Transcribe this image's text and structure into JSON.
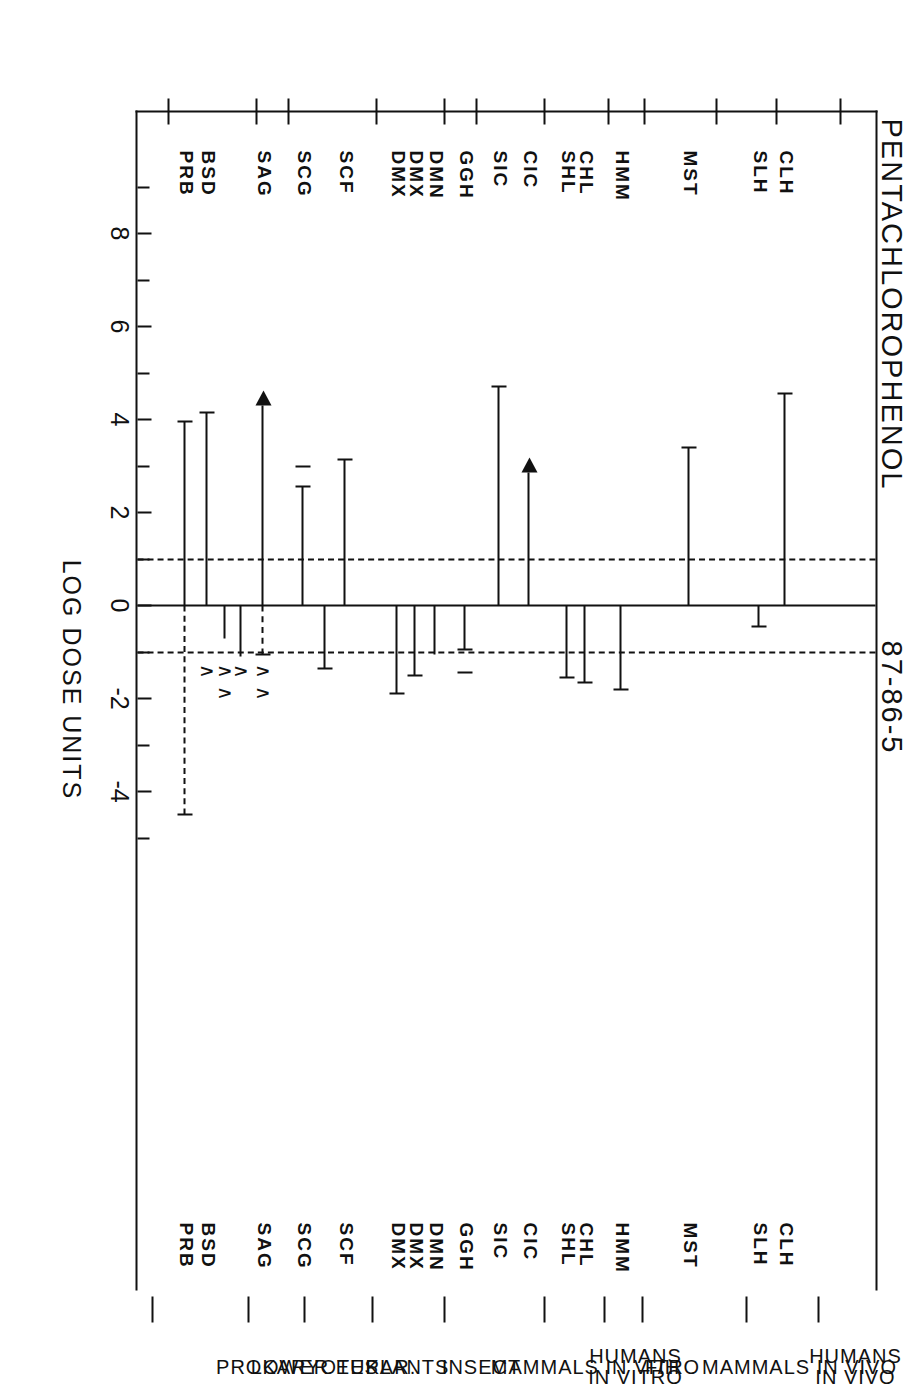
{
  "title": {
    "chemical_name": "PENTACHLOROPHENOL",
    "cas_number": "87-86-5"
  },
  "axis": {
    "label": "LOG DOSE UNITS",
    "ticks": [
      8,
      6,
      4,
      2,
      0,
      -2,
      -4
    ],
    "tick_labels": [
      "8",
      "6",
      "4",
      "2",
      "0",
      "-2",
      "-4"
    ],
    "minor_ticks": [
      9,
      7,
      5,
      3,
      1,
      -1,
      -3,
      -5
    ],
    "range": [
      9.5,
      -5.5
    ]
  },
  "reference_lines": {
    "zero_solid": 0,
    "dashed": [
      1,
      -1
    ]
  },
  "categories": [
    {
      "name": "PROKARYOTES"
    },
    {
      "name": "LOWER EUKAR."
    },
    {
      "name": "PLANTS"
    },
    {
      "name": "INSECT"
    },
    {
      "name": "MAMMALS IN VITRO"
    },
    {
      "name": "HUMANS\nIN VITRO"
    },
    {
      "name": "F/H"
    },
    {
      "name": "MAMMALS IN VIVO"
    },
    {
      "name": "HUMANS\nIN VIVO"
    }
  ],
  "chart_data": {
    "type": "bar",
    "title": "PENTACHLOROPHENOL  87-86-5",
    "xlabel": "LOG DOSE UNITS",
    "ylabel": "",
    "xlim": [
      9.5,
      -5.5
    ],
    "grid": false,
    "orientation": "horizontal-intervals",
    "note": "Each row is a study: a horizontal interval in log dose units anchored at 0. Caps mark determinate endpoints, arrowheads mark open-ended (greater-than) endpoints.",
    "rows": [
      {
        "code": "PRB",
        "category": "PROKARYOTES",
        "start": 0,
        "end": 3.95,
        "end_marker": "cap",
        "extra_dashed_to": -4.5,
        "carets": 0
      },
      {
        "code": "BSD",
        "category": "PROKARYOTES",
        "start": 0,
        "end": 4.15,
        "end_marker": "cap",
        "carets": 1
      },
      {
        "code": "",
        "category": "PROKARYOTES",
        "start": 0,
        "end": -0.7,
        "end_marker": "caret",
        "carets": 2
      },
      {
        "code": "",
        "category": "PROKARYOTES",
        "start": 0,
        "end": -1.1,
        "end_marker": "caret",
        "carets": 1
      },
      {
        "code": "SAG",
        "category": "PROKARYOTES",
        "start": 0,
        "end": 4.3,
        "end_marker": "arrow",
        "extra_dashed_to": -1.05,
        "carets": 2
      },
      {
        "code": "SCG",
        "category": "LOWER EUKAR.",
        "start": 0,
        "end": 2.55,
        "end_marker": "cap",
        "lone_cap_at": 3.0
      },
      {
        "code": "",
        "category": "LOWER EUKAR.",
        "start": 0,
        "end": -1.35,
        "end_marker": "cap"
      },
      {
        "code": "SCF",
        "category": "LOWER EUKAR.",
        "start": 0,
        "end": 3.15,
        "end_marker": "cap"
      },
      {
        "code": "DMX",
        "category": "INSECT",
        "start": 0,
        "end": -1.9,
        "end_marker": "cap"
      },
      {
        "code": "DMX",
        "category": "INSECT",
        "start": 0,
        "end": -1.5,
        "end_marker": "cap"
      },
      {
        "code": "DMN",
        "category": "INSECT",
        "start": 0,
        "end": -1.05,
        "end_marker": "none"
      },
      {
        "code": "GGH",
        "category": "MAMMALS IN VITRO",
        "start": 0,
        "end": -0.95,
        "end_marker": "cap",
        "lone_cap_at": -1.45
      },
      {
        "code": "SIC",
        "category": "MAMMALS IN VITRO",
        "start": 0,
        "end": 4.7,
        "end_marker": "cap"
      },
      {
        "code": "CIC",
        "category": "MAMMALS IN VITRO",
        "start": 0,
        "end": 2.85,
        "end_marker": "arrow"
      },
      {
        "code": "SHL",
        "category": "HUMANS IN VITRO",
        "start": 0,
        "end": -1.55,
        "end_marker": "cap"
      },
      {
        "code": "CHL",
        "category": "HUMANS IN VITRO",
        "start": 0,
        "end": -1.65,
        "end_marker": "cap"
      },
      {
        "code": "HMM",
        "category": "F/H",
        "start": 0,
        "end": -1.8,
        "end_marker": "cap"
      },
      {
        "code": "MST",
        "category": "MAMMALS IN VIVO",
        "start": 0,
        "end": 3.4,
        "end_marker": "cap"
      },
      {
        "code": "SLH",
        "category": "HUMANS IN VIVO",
        "start": 0,
        "end": -0.45,
        "end_marker": "cap"
      },
      {
        "code": "CLH",
        "category": "HUMANS IN VIVO",
        "start": 0,
        "end": 4.55,
        "end_marker": "cap"
      }
    ]
  }
}
